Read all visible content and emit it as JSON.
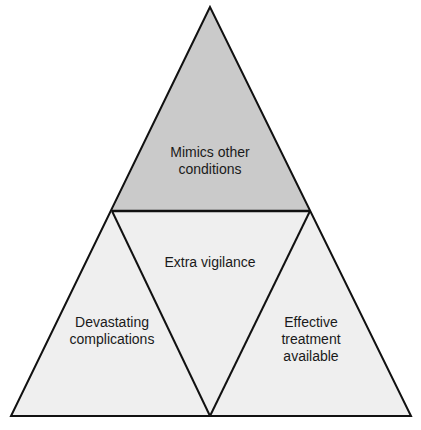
{
  "diagram": {
    "type": "triangle-divided",
    "colors": {
      "top_fill": "#cacaca",
      "bottom_fill": "#efefef",
      "stroke": "#111111",
      "text": "#1a1a1a"
    },
    "sections": [
      {
        "id": "top",
        "label": "Mimics other\nconditions"
      },
      {
        "id": "center",
        "label": "Extra vigilance"
      },
      {
        "id": "bottom-left",
        "label": "Devastating\ncomplications"
      },
      {
        "id": "bottom-right",
        "label": "Effective\ntreatment\navailable"
      }
    ]
  }
}
